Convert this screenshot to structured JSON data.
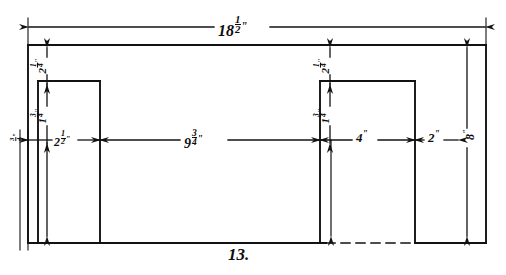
{
  "figure": {
    "number_label": "13."
  },
  "dimensions": {
    "overall_width": {
      "whole": "18",
      "num": "1",
      "den": "2",
      "unit": "\""
    },
    "overall_height": {
      "whole": "8",
      "unit": "\""
    },
    "top_margin_left": {
      "whole": "2",
      "num": "1",
      "den": "4",
      "unit": "\""
    },
    "top_margin_right": {
      "whole": "2",
      "num": "1",
      "den": "4",
      "unit": "\""
    },
    "notch_height_left": {
      "whole": "1",
      "num": "3",
      "den": "4",
      "unit": "\""
    },
    "notch_height_right": {
      "whole": "1",
      "num": "3",
      "den": "4",
      "unit": "\""
    },
    "edge_offset": {
      "whole": "",
      "num": "3",
      "den": "4",
      "unit": "\""
    },
    "left_notch_width": {
      "whole": "2",
      "num": "1",
      "den": "2",
      "unit": "\""
    },
    "center_span": {
      "whole": "9",
      "num": "3",
      "den": "4",
      "unit": "\""
    },
    "right_notch_width": {
      "whole": "4",
      "unit": "\""
    },
    "right_margin": {
      "whole": "2",
      "unit": "\""
    }
  },
  "style": {
    "ink": "#121212",
    "paper": "#ffffff",
    "line_weight": 1.7,
    "thin_weight": 1.0
  }
}
